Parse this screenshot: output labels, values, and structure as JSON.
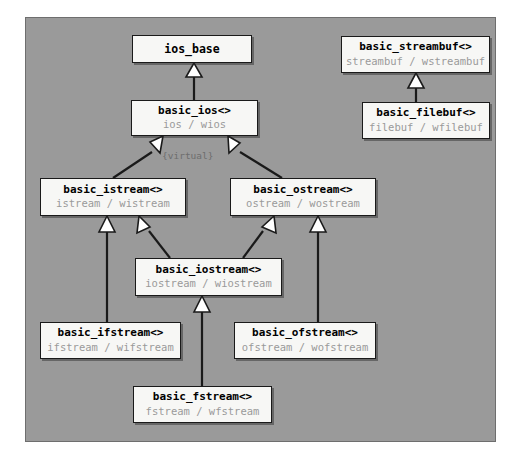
{
  "diagram": {
    "panel": {
      "background_color": "#9a9a9a",
      "border_color": "#6e6e6e"
    },
    "colors": {
      "node_fill": "#f7f7f5",
      "node_border": "#1a1a1a",
      "class_name_text": "#000000",
      "typedef_text": "#9a9a9a",
      "edge": "#1a1a1a",
      "arrowhead_fill": "#ffffff",
      "note_text": "#6d6d6d",
      "page_background": "#ffffff"
    },
    "virtual_label": "{virtual}",
    "nodes": [
      {
        "id": "ios_base",
        "name": "ios_base",
        "typedefs": "",
        "x": 132,
        "y": 35,
        "w": 120,
        "h": 28
      },
      {
        "id": "basic_ios",
        "name": "basic_ios<>",
        "typedefs": "ios / wios",
        "x": 131,
        "y": 100,
        "w": 127,
        "h": 36
      },
      {
        "id": "basic_streambuf",
        "name": "basic_streambuf<>",
        "typedefs": "streambuf / wstreambuf",
        "x": 341,
        "y": 36,
        "w": 149,
        "h": 37
      },
      {
        "id": "basic_filebuf",
        "name": "basic_filebuf<>",
        "typedefs": "filebuf / wfilebuf",
        "x": 362,
        "y": 102,
        "w": 128,
        "h": 37
      },
      {
        "id": "basic_istream",
        "name": "basic_istream<>",
        "typedefs": "istream / wistream",
        "x": 40,
        "y": 178,
        "w": 146,
        "h": 38
      },
      {
        "id": "basic_ostream",
        "name": "basic_ostream<>",
        "typedefs": "ostream / wostream",
        "x": 230,
        "y": 178,
        "w": 146,
        "h": 38
      },
      {
        "id": "basic_iostream",
        "name": "basic_iostream<>",
        "typedefs": "iostream / wiostream",
        "x": 135,
        "y": 258,
        "w": 147,
        "h": 38
      },
      {
        "id": "basic_ifstream",
        "name": "basic_ifstream<>",
        "typedefs": "ifstream / wifstream",
        "x": 40,
        "y": 322,
        "w": 141,
        "h": 37
      },
      {
        "id": "basic_ofstream",
        "name": "basic_ofstream<>",
        "typedefs": "ofstream / wofstream",
        "x": 234,
        "y": 322,
        "w": 142,
        "h": 37
      },
      {
        "id": "basic_fstream",
        "name": "basic_fstream<>",
        "typedefs": "fstream / wfstream",
        "x": 133,
        "y": 386,
        "w": 139,
        "h": 37
      }
    ],
    "edges": [
      {
        "from": "basic_ios",
        "to": "ios_base",
        "kind": "inheritance"
      },
      {
        "from": "basic_filebuf",
        "to": "basic_streambuf",
        "kind": "inheritance"
      },
      {
        "from": "basic_istream",
        "to": "basic_ios",
        "kind": "virtual-inheritance"
      },
      {
        "from": "basic_ostream",
        "to": "basic_ios",
        "kind": "virtual-inheritance"
      },
      {
        "from": "basic_iostream",
        "to": "basic_istream",
        "kind": "inheritance"
      },
      {
        "from": "basic_iostream",
        "to": "basic_ostream",
        "kind": "inheritance"
      },
      {
        "from": "basic_ifstream",
        "to": "basic_istream",
        "kind": "inheritance"
      },
      {
        "from": "basic_ofstream",
        "to": "basic_ostream",
        "kind": "inheritance"
      },
      {
        "from": "basic_fstream",
        "to": "basic_iostream",
        "kind": "inheritance"
      }
    ]
  }
}
